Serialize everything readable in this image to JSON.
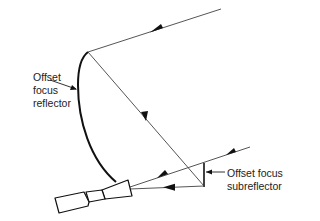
{
  "diagram": {
    "type": "offset-focus-antenna",
    "labels": {
      "reflector": [
        "Offset",
        "focus",
        "reflector"
      ],
      "subreflector": [
        "Offset focus",
        "subreflector"
      ]
    },
    "colors": {
      "line": "#555555",
      "outline": "#111111",
      "text": "#222222"
    }
  }
}
